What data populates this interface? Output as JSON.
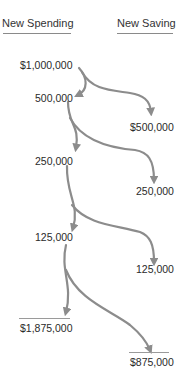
{
  "headers": {
    "spending": "New Spending",
    "saving": "New Saving"
  },
  "spending_steps": [
    "$1,000,000",
    "500,000",
    "250,000",
    "125,000"
  ],
  "saving_steps": [
    "$500,000",
    "250,000",
    "125,000"
  ],
  "totals": {
    "spending": "$1,875,000",
    "saving": "$875,000"
  },
  "colors": {
    "arrow": "#8c8c8c",
    "text": "#2a2a2a",
    "rule": "#9a9a9a"
  }
}
